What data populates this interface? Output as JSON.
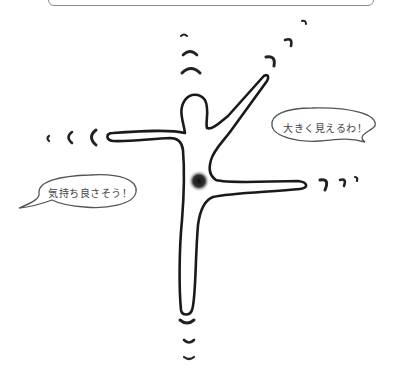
{
  "figure": {
    "colors": {
      "line": "#1a1a1a",
      "bubble_border": "#555555",
      "text": "#444444",
      "core_dot": "#222222"
    }
  },
  "bubbles": [
    {
      "id": "right",
      "text": "大きく見えるわ！"
    },
    {
      "id": "left",
      "text": "気持ち良さそう！"
    }
  ],
  "annotations": {
    "core_marker": "core-focus-dot",
    "motion_marks": [
      "up-from-head",
      "up-right-from-arm",
      "left-from-arm",
      "right-from-leg",
      "down-from-foot"
    ]
  }
}
